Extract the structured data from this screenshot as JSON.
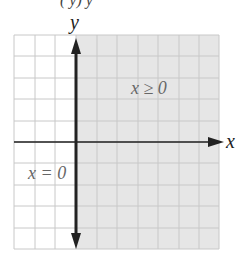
{
  "header_fragment": "(         y)             y",
  "graph": {
    "grid": {
      "columns": 10,
      "rows": 10,
      "left": 14,
      "top": 35,
      "cell": 21.4
    },
    "axes": {
      "x_label": "x",
      "y_label": "y",
      "y_axis_column": 3,
      "x_axis_row": 5
    },
    "shaded_region": {
      "label": "x ≥ 0",
      "color": "#e6e6e6",
      "from_column": 3,
      "to_column": 10
    },
    "boundary_line": {
      "label": "x = 0",
      "style": "solid"
    },
    "colors": {
      "grid": "#c8c8c8",
      "axis": "#222222",
      "shade": "#e6e6e6",
      "label": "#666666"
    }
  }
}
